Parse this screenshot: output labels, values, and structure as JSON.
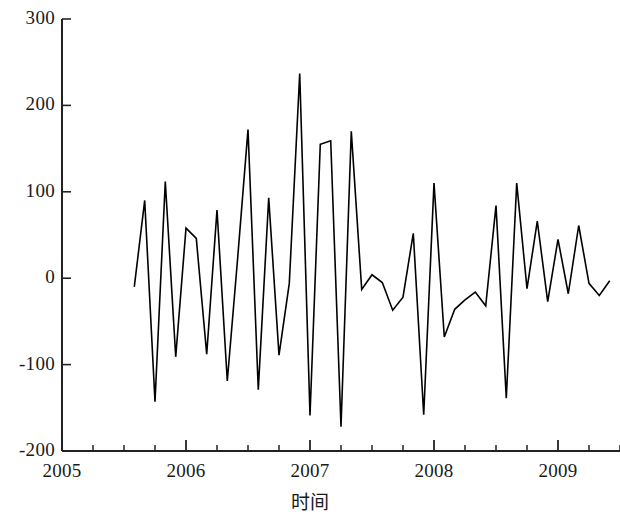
{
  "chart_data": {
    "type": "line",
    "title": "",
    "subtitle": "",
    "xlabel": "时间",
    "ylabel": "",
    "xlim": [
      2005.0,
      2009.5
    ],
    "ylim": [
      -200,
      300
    ],
    "grid": false,
    "legend": null,
    "legend_position": "none",
    "x_tick_labels": [
      "2005",
      "2006",
      "2007",
      "2008",
      "2009"
    ],
    "x_major_ticks": [
      2005,
      2006,
      2007,
      2008,
      2009
    ],
    "x_minor_tick_interval": 0.25,
    "y_tick_labels": [
      "300",
      "200",
      "100",
      "0",
      "-100",
      "-200"
    ],
    "y_ticks": [
      300,
      200,
      100,
      0,
      -100,
      -200
    ],
    "series": [
      {
        "name": "residual",
        "color": "#000000",
        "x": [
          2005.583,
          2005.667,
          2005.75,
          2005.833,
          2005.917,
          2006.0,
          2006.083,
          2006.167,
          2006.25,
          2006.333,
          2006.417,
          2006.5,
          2006.583,
          2006.667,
          2006.75,
          2006.833,
          2006.917,
          2007.0,
          2007.083,
          2007.167,
          2007.25,
          2007.333,
          2007.417,
          2007.5,
          2007.583,
          2007.667,
          2007.75,
          2007.833,
          2007.917,
          2008.0,
          2008.083,
          2008.167,
          2008.25,
          2008.333,
          2008.417,
          2008.5,
          2008.583,
          2008.667,
          2008.75,
          2008.833,
          2008.917,
          2009.0,
          2009.083,
          2009.167,
          2009.25,
          2009.333,
          2009.417
        ],
        "y": [
          -10,
          90,
          -143,
          112,
          -91,
          58,
          46,
          -88,
          79,
          -119,
          24,
          172,
          -129,
          93,
          -89,
          -6,
          237,
          -159,
          155,
          159,
          -172,
          170,
          -13,
          4,
          -5,
          -37,
          -22,
          52,
          -158,
          110,
          -68,
          -36,
          -25,
          -16,
          -32,
          84,
          -139,
          110,
          -12,
          66,
          -27,
          45,
          -18,
          61,
          -6,
          -20,
          -3
        ]
      }
    ]
  },
  "axis": {
    "x_title": "时间",
    "line_color": "#222222"
  }
}
